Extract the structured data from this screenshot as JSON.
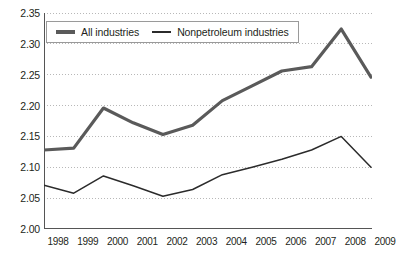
{
  "chart_data": {
    "type": "line",
    "title": "",
    "subtitle": "",
    "xlabel": "",
    "ylabel": "",
    "categories": [
      "1998",
      "1999",
      "2000",
      "2001",
      "2002",
      "2003",
      "2004",
      "2005",
      "2006",
      "2007",
      "2008",
      "2009"
    ],
    "x": [
      1998,
      1999,
      2000,
      2001,
      2002,
      2003,
      2004,
      2005,
      2006,
      2007,
      2008,
      2009
    ],
    "ylim": [
      2.0,
      2.35
    ],
    "ytick_labels": [
      "2.00",
      "2.05",
      "2.10",
      "2.15",
      "2.20",
      "2.25",
      "2.30",
      "2.35"
    ],
    "ytick_values": [
      2.0,
      2.05,
      2.1,
      2.15,
      2.2,
      2.25,
      2.3,
      2.35
    ],
    "grid": true,
    "grid_style": "dotted-horizontal",
    "legend_position": "top-left-inside",
    "series": [
      {
        "name": "All industries",
        "color": "#5a5a5a",
        "line_width": "thick",
        "values": [
          2.128,
          2.131,
          2.196,
          2.172,
          2.153,
          2.168,
          2.208,
          2.232,
          2.256,
          2.263,
          2.324,
          2.246
        ]
      },
      {
        "name": "Nonpetroleum industries",
        "color": "#2b2b2b",
        "line_width": "thin",
        "values": [
          2.071,
          2.058,
          2.086,
          2.07,
          2.053,
          2.064,
          2.088,
          2.1,
          2.113,
          2.128,
          2.15,
          2.1
        ]
      }
    ]
  },
  "legend": {
    "entries": [
      {
        "label": "All industries"
      },
      {
        "label": "Nonpetroleum industries"
      }
    ]
  },
  "colors": {
    "axis": "#555555",
    "grid": "#b8b8b8",
    "series_all_industries": "#5a5a5a",
    "series_nonpetroleum": "#2b2b2b",
    "text": "#231f20",
    "background": "#ffffff"
  }
}
